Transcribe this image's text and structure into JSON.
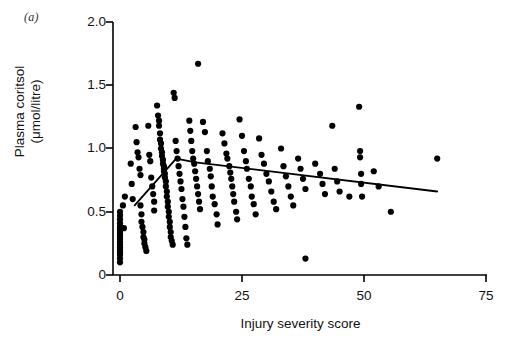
{
  "figure": {
    "panel_label": "(a)",
    "background_color": "#ffffff",
    "ink_color": "#000000"
  },
  "axes": {
    "x_title": "Injury severity score",
    "y_title": "Plasma coritsol\n(μmol/litre)",
    "x_tick_labels": [
      "0",
      "25",
      "50",
      "75"
    ],
    "y_tick_labels": [
      "0",
      "0.5",
      "1.0",
      "1.5",
      "2.0"
    ]
  },
  "chart_data": {
    "type": "scatter",
    "title": "",
    "xlabel": "Injury severity score",
    "ylabel": "Plasma coritsol (μmol/litre)",
    "xlim": [
      0,
      75
    ],
    "ylim": [
      0,
      2.0
    ],
    "xticks": [
      0,
      25,
      50,
      75
    ],
    "yticks": [
      0,
      0.5,
      1.0,
      1.5,
      2.0
    ],
    "grid": false,
    "legend": null,
    "marker": "filled-circle",
    "marker_color": "#000000",
    "series": [
      {
        "name": "patients",
        "type": "scatter",
        "points": [
          [
            0,
            0.5
          ],
          [
            0,
            0.47
          ],
          [
            0,
            0.44
          ],
          [
            0,
            0.41
          ],
          [
            0,
            0.38
          ],
          [
            0,
            0.36
          ],
          [
            0,
            0.34
          ],
          [
            0,
            0.32
          ],
          [
            0,
            0.3
          ],
          [
            0,
            0.28
          ],
          [
            0,
            0.26
          ],
          [
            0,
            0.24
          ],
          [
            0,
            0.22
          ],
          [
            0,
            0.2
          ],
          [
            0,
            0.18
          ],
          [
            0,
            0.16
          ],
          [
            0,
            0.13
          ],
          [
            0,
            0.1
          ],
          [
            0.6,
            0.55
          ],
          [
            0.8,
            0.37
          ],
          [
            1.0,
            0.62
          ],
          [
            2.2,
            0.88
          ],
          [
            2.4,
            0.72
          ],
          [
            2.6,
            0.6
          ],
          [
            3.2,
            1.17
          ],
          [
            3.4,
            1.05
          ],
          [
            3.6,
            0.97
          ],
          [
            3.8,
            0.93
          ],
          [
            4.0,
            0.84
          ],
          [
            4.2,
            0.79
          ],
          [
            4.2,
            0.55
          ],
          [
            4.4,
            0.48
          ],
          [
            4.4,
            0.42
          ],
          [
            4.6,
            0.38
          ],
          [
            4.8,
            0.34
          ],
          [
            4.8,
            0.3
          ],
          [
            5.0,
            0.28
          ],
          [
            5.0,
            0.25
          ],
          [
            5.2,
            0.22
          ],
          [
            5.4,
            0.19
          ],
          [
            5.8,
            1.18
          ],
          [
            6.0,
            0.95
          ],
          [
            6.2,
            0.9
          ],
          [
            6.4,
            0.77
          ],
          [
            6.6,
            0.7
          ],
          [
            6.8,
            0.64
          ],
          [
            7.0,
            0.58
          ],
          [
            7.0,
            0.51
          ],
          [
            7.6,
            1.34
          ],
          [
            7.8,
            1.26
          ],
          [
            8.0,
            1.22
          ],
          [
            8.0,
            1.18
          ],
          [
            8.2,
            1.12
          ],
          [
            8.2,
            1.07
          ],
          [
            8.4,
            1.04
          ],
          [
            8.4,
            1.0
          ],
          [
            8.6,
            0.97
          ],
          [
            8.6,
            0.94
          ],
          [
            8.8,
            0.91
          ],
          [
            8.8,
            0.88
          ],
          [
            9.0,
            0.86
          ],
          [
            9.0,
            0.84
          ],
          [
            9.0,
            0.82
          ],
          [
            9.2,
            0.8
          ],
          [
            9.2,
            0.77
          ],
          [
            9.4,
            0.74
          ],
          [
            9.4,
            0.7
          ],
          [
            9.6,
            0.66
          ],
          [
            9.6,
            0.62
          ],
          [
            9.8,
            0.58
          ],
          [
            9.8,
            0.54
          ],
          [
            10.0,
            0.5
          ],
          [
            10.0,
            0.46
          ],
          [
            10.2,
            0.42
          ],
          [
            10.2,
            0.38
          ],
          [
            10.4,
            0.34
          ],
          [
            10.4,
            0.3
          ],
          [
            10.6,
            0.27
          ],
          [
            10.8,
            0.24
          ],
          [
            11.0,
            1.44
          ],
          [
            11.2,
            1.4
          ],
          [
            11.4,
            1.06
          ],
          [
            11.6,
            0.98
          ],
          [
            11.8,
            0.92
          ],
          [
            12.0,
            0.86
          ],
          [
            12.2,
            0.8
          ],
          [
            12.4,
            0.74
          ],
          [
            12.6,
            0.68
          ],
          [
            12.8,
            0.6
          ],
          [
            13.0,
            0.54
          ],
          [
            13.2,
            0.46
          ],
          [
            13.4,
            0.38
          ],
          [
            13.6,
            0.29
          ],
          [
            13.8,
            0.24
          ],
          [
            14.2,
            1.22
          ],
          [
            14.4,
            1.14
          ],
          [
            14.6,
            1.06
          ],
          [
            14.8,
            0.98
          ],
          [
            15.0,
            0.92
          ],
          [
            15.2,
            0.88
          ],
          [
            15.4,
            0.82
          ],
          [
            15.6,
            0.76
          ],
          [
            15.8,
            0.7
          ],
          [
            16.0,
            0.64
          ],
          [
            16.2,
            0.58
          ],
          [
            16.4,
            0.52
          ],
          [
            16.0,
            1.67
          ],
          [
            17.0,
            1.21
          ],
          [
            17.4,
            1.13
          ],
          [
            17.8,
            0.98
          ],
          [
            18.0,
            0.9
          ],
          [
            18.4,
            0.84
          ],
          [
            18.6,
            0.78
          ],
          [
            18.8,
            0.7
          ],
          [
            19.0,
            0.62
          ],
          [
            19.4,
            0.56
          ],
          [
            19.8,
            0.48
          ],
          [
            20.0,
            0.4
          ],
          [
            21.0,
            1.12
          ],
          [
            21.4,
            1.04
          ],
          [
            21.8,
            0.96
          ],
          [
            22.0,
            0.92
          ],
          [
            22.4,
            0.86
          ],
          [
            22.6,
            0.81
          ],
          [
            22.8,
            0.76
          ],
          [
            23.0,
            0.7
          ],
          [
            23.2,
            0.64
          ],
          [
            23.4,
            0.58
          ],
          [
            23.8,
            0.5
          ],
          [
            24.0,
            0.44
          ],
          [
            24.5,
            1.23
          ],
          [
            25.0,
            1.1
          ],
          [
            25.4,
            0.98
          ],
          [
            25.8,
            0.9
          ],
          [
            26.0,
            0.84
          ],
          [
            26.4,
            0.76
          ],
          [
            26.8,
            0.7
          ],
          [
            27.0,
            0.62
          ],
          [
            27.4,
            0.56
          ],
          [
            27.8,
            0.48
          ],
          [
            28.5,
            1.08
          ],
          [
            29.0,
            0.95
          ],
          [
            29.5,
            0.88
          ],
          [
            30.0,
            0.8
          ],
          [
            30.5,
            0.74
          ],
          [
            31.0,
            0.66
          ],
          [
            31.5,
            0.58
          ],
          [
            32.0,
            0.52
          ],
          [
            33.0,
            1.0
          ],
          [
            33.5,
            0.86
          ],
          [
            34.0,
            0.78
          ],
          [
            34.5,
            0.7
          ],
          [
            35.0,
            0.62
          ],
          [
            35.5,
            0.55
          ],
          [
            36.5,
            0.92
          ],
          [
            37.0,
            0.84
          ],
          [
            37.5,
            0.76
          ],
          [
            38.0,
            0.68
          ],
          [
            38.0,
            0.13
          ],
          [
            40.0,
            0.88
          ],
          [
            41.0,
            0.8
          ],
          [
            41.5,
            0.72
          ],
          [
            42.0,
            0.64
          ],
          [
            43.5,
            1.18
          ],
          [
            44.0,
            0.84
          ],
          [
            44.5,
            0.74
          ],
          [
            45.0,
            0.66
          ],
          [
            47.0,
            0.62
          ],
          [
            49.0,
            1.33
          ],
          [
            49.2,
            0.98
          ],
          [
            49.2,
            0.93
          ],
          [
            49.4,
            0.8
          ],
          [
            49.4,
            0.72
          ],
          [
            49.6,
            0.62
          ],
          [
            52.0,
            0.82
          ],
          [
            53.0,
            0.7
          ],
          [
            55.5,
            0.5
          ],
          [
            65.0,
            0.92
          ]
        ]
      }
    ],
    "fit_line": {
      "name": "fitted-regression-curve",
      "description": "Rising then slowly declining fitted line",
      "vertices": [
        [
          3.0,
          0.55
        ],
        [
          11.5,
          0.92
        ],
        [
          15.5,
          0.89
        ],
        [
          65.0,
          0.66
        ]
      ],
      "color": "#000000",
      "width_px": 1.8
    }
  }
}
